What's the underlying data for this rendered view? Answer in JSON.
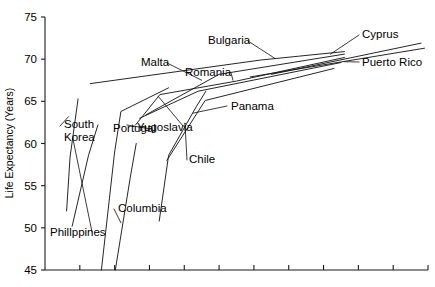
{
  "chart_data": {
    "type": "line",
    "title": "",
    "xlabel": "",
    "ylabel": "Life Expectancy (Years)",
    "ylim": [
      45,
      75
    ],
    "yticks": [
      45,
      50,
      55,
      60,
      65,
      70,
      75
    ],
    "ytick_labels": [
      "45",
      "50",
      "55",
      "60",
      "65",
      "70",
      "75"
    ],
    "xlim": [
      0,
      11
    ],
    "xticks": [
      0,
      1,
      2,
      3,
      4,
      5,
      6,
      7,
      8,
      9,
      10,
      11
    ],
    "xtick_labels": [
      "",
      "",
      "",
      "",
      "",
      "",
      "",
      "",
      "",
      "",
      "",
      ""
    ],
    "grid": false,
    "legend": "inline-labels",
    "series": [
      {
        "name": "Phillppines",
        "label": "Phillppines",
        "label_x": 50,
        "label_y": 236,
        "points": [
          [
            0.62,
            52.0
          ],
          [
            0.72,
            58.4
          ],
          [
            0.95,
            65.3
          ]
        ]
      },
      {
        "name": "South Korea",
        "label": "South Korea",
        "label_x": 64,
        "label_y": 128,
        "points": [
          [
            0.78,
            50.2
          ],
          [
            1.25,
            58.6
          ],
          [
            1.52,
            62.2
          ]
        ]
      },
      {
        "name": "Portugal",
        "label": "Portugal",
        "label_x": 113,
        "label_y": 132,
        "points": [
          [
            1.62,
            45.0
          ],
          [
            2.0,
            59.0
          ],
          [
            2.18,
            63.8
          ],
          [
            3.55,
            66.6
          ]
        ]
      },
      {
        "name": "Columbia",
        "label": "Columbia",
        "label_x": 118,
        "label_y": 212,
        "points": [
          [
            2.02,
            45.0
          ],
          [
            2.45,
            56.0
          ],
          [
            2.62,
            60.0
          ]
        ]
      },
      {
        "name": "Yugoslavia",
        "label": "Yugoslavia",
        "label_x": 137,
        "label_y": 131,
        "points": [
          [
            2.6,
            62.2
          ],
          [
            3.3,
            65.8
          ],
          [
            5.5,
            67.4
          ],
          [
            8.6,
            70.2
          ]
        ]
      },
      {
        "name": "Chile",
        "label": "Chile",
        "label_x": 189,
        "label_y": 163,
        "points": [
          [
            3.28,
            50.8
          ],
          [
            3.55,
            58.6
          ],
          [
            4.35,
            64.4
          ],
          [
            4.62,
            66.2
          ]
        ]
      },
      {
        "name": "Romania",
        "label": "Romania",
        "label_x": 185,
        "label_y": 76,
        "points": [
          [
            2.72,
            63.0
          ],
          [
            4.4,
            66.2
          ],
          [
            8.5,
            69.6
          ]
        ]
      },
      {
        "name": "Malta",
        "label": "Malta",
        "label_x": 141,
        "label_y": 66,
        "points": [
          [
            2.9,
            63.4
          ],
          [
            5.0,
            68.2
          ],
          [
            8.6,
            70.6
          ]
        ]
      },
      {
        "name": "Bulgaria",
        "label": "Bulgaria",
        "label_x": 208,
        "label_y": 44,
        "points": [
          [
            1.3,
            67.1
          ],
          [
            6.2,
            69.9
          ],
          [
            8.6,
            70.9
          ]
        ]
      },
      {
        "name": "Panama",
        "label": "Panama",
        "label_x": 231,
        "label_y": 110,
        "points": [
          [
            3.5,
            58.0
          ],
          [
            4.6,
            65.1
          ],
          [
            8.3,
            68.9
          ]
        ]
      },
      {
        "name": "Cyprus",
        "label": "Cyprus",
        "label_x": 362,
        "label_y": 38,
        "points": [
          [
            6.5,
            68.2
          ],
          [
            10.8,
            71.9
          ]
        ]
      },
      {
        "name": "Puerto Rico",
        "label": "Puerto Rico",
        "label_x": 362,
        "label_y": 66,
        "points": [
          [
            5.9,
            67.9
          ],
          [
            10.9,
            71.3
          ]
        ]
      }
    ]
  },
  "axes": {
    "y_axis_title": "Life Expectancy (Years)",
    "y_tick_labels": [
      "75",
      "70",
      "65",
      "60",
      "55",
      "50",
      "45"
    ]
  }
}
